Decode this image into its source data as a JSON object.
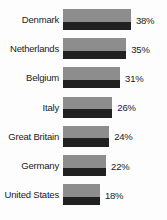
{
  "chart_data": {
    "type": "bar",
    "orientation": "horizontal",
    "title": "",
    "subtitle": "",
    "xlabel": "",
    "ylabel": "",
    "grid": false,
    "legend": null,
    "xlim": [
      0,
      38
    ],
    "categories": [
      "Denmark",
      "Netherlands",
      "Belgium",
      "Italy",
      "Great Britain",
      "Germany",
      "United States"
    ],
    "values": [
      38,
      35,
      31,
      26,
      24,
      22,
      18
    ],
    "value_labels": [
      "38%",
      "35%",
      "31%",
      "26%",
      "24%",
      "22%",
      "18%"
    ],
    "bar_style": {
      "top_color": "#8d8d8d",
      "bottom_color": "#212121",
      "top_fraction": 0.6
    },
    "background_color": "#fdfdfd",
    "text_color": "#1a1a1a"
  }
}
